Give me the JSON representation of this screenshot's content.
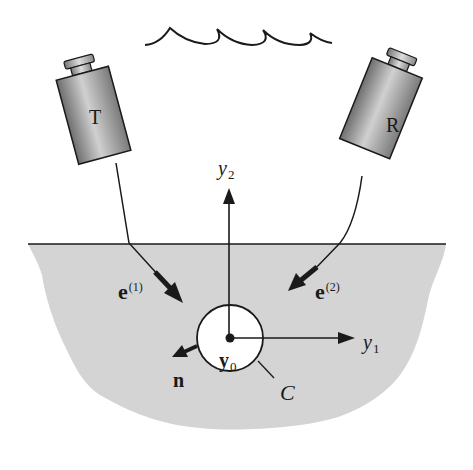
{
  "figure": {
    "colors": {
      "background": "#ffffff",
      "medium_fill": "#d4d4d4",
      "ink": "#1a1a1a",
      "circle_fill": "#ffffff",
      "device_dark": "#6e6e6e",
      "device_light": "#c8c8c8"
    }
  },
  "devices": {
    "transmitter": {
      "label": "T"
    },
    "receiver": {
      "label": "R"
    }
  },
  "labels": {
    "e1_base": "e",
    "e1_sup": "(1)",
    "e2_base": "e",
    "e2_sup": "(2)",
    "n": "n",
    "y0_base": "y",
    "y0_sub": "0",
    "y1_base": "y",
    "y1_sub": "1",
    "y2_base": "y",
    "y2_sub": "2",
    "contour": "C"
  }
}
